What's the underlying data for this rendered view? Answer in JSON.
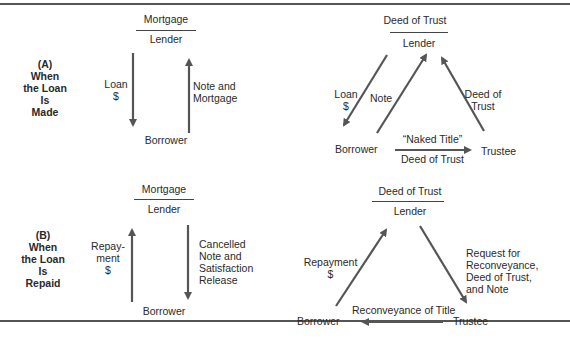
{
  "section_a": {
    "label": [
      "(A)",
      "When",
      "the Loan",
      "Is",
      "Made"
    ],
    "mortgage": {
      "instrument": "Mortgage",
      "lender": "Lender",
      "borrower": "Borrower",
      "down_arrow": [
        "Loan",
        "$"
      ],
      "up_arrow": [
        "Note and",
        "Mortgage"
      ]
    },
    "deed": {
      "instrument": "Deed of Trust",
      "lender": "Lender",
      "borrower": "Borrower",
      "trustee": "Trustee",
      "loan": [
        "Loan",
        "$"
      ],
      "note": "Note",
      "deed_to_lender": [
        "Deed of",
        "Trust"
      ],
      "naked_title": "“Naked Title”",
      "deed_of_trust": "Deed of Trust"
    }
  },
  "section_b": {
    "label": [
      "(B)",
      "When",
      "the Loan",
      "Is",
      "Repaid"
    ],
    "mortgage": {
      "instrument": "Mortgage",
      "lender": "Lender",
      "borrower": "Borrower",
      "up_arrow": [
        "Repay-",
        "ment",
        "$"
      ],
      "down_arrow": [
        "Cancelled",
        "Note and",
        "Satisfaction",
        "Release"
      ]
    },
    "deed": {
      "instrument": "Deed of Trust",
      "lender": "Lender",
      "borrower": "Borrower",
      "trustee": "Trustee",
      "repayment": [
        "Repayment",
        "$"
      ],
      "request": [
        "Request for",
        "Reconveyance,",
        "Deed of Trust,",
        "and Note"
      ],
      "reconveyance": "Reconveyance of Title"
    }
  }
}
